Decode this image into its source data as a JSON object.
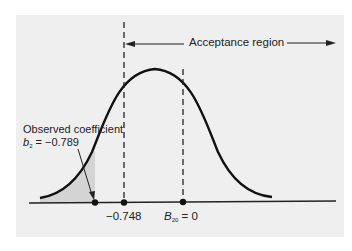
{
  "diagram": {
    "region": {
      "label": "Acceptance region"
    },
    "observed": {
      "line1": "Observed coefficient",
      "symbol": "b",
      "subscript": "2",
      "value_text": " = −0.789",
      "value": -0.789
    },
    "critical": {
      "label": "−0.748",
      "value": -0.748
    },
    "null_hypothesis": {
      "symbol": "B",
      "subscript": "20",
      "value_text": " = 0",
      "value": 0
    },
    "colors": {
      "background": "#efefef",
      "curve": "#111111",
      "shaded_tail": "#d4d4d4"
    }
  }
}
